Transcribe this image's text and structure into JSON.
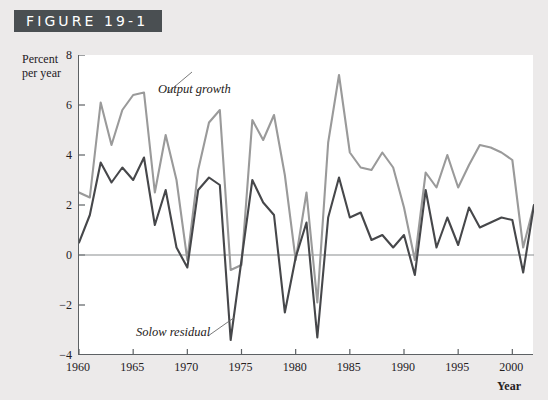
{
  "figure": {
    "banner_label": "FIGURE 19-1"
  },
  "axes": {
    "ylabel_line1": "Percent",
    "ylabel_line2": "per year",
    "xlabel": "Year",
    "yticks": [
      8,
      6,
      4,
      2,
      0,
      -2,
      -4
    ],
    "ytick_labels": [
      "8",
      "6",
      "4",
      "2",
      "0",
      "−2",
      "−4"
    ],
    "xticks": [
      1960,
      1965,
      1970,
      1975,
      1980,
      1985,
      1990,
      1995,
      2000
    ],
    "xtick_labels": [
      "1960",
      "1965",
      "1970",
      "1975",
      "1980",
      "1985",
      "1990",
      "1995",
      "2000"
    ]
  },
  "annotations": {
    "output_growth": "Output growth",
    "solow_residual": "Solow residual"
  },
  "colors": {
    "banner_background": "#4a4f52",
    "banner_text": "#ffffff",
    "page_background": "#eceaea",
    "plot_background": "#ffffff",
    "axis": "#5d6164",
    "zero_line": "#8a8e90",
    "output_growth_line": "#9a9a9a",
    "solow_residual_line": "#46474a",
    "leader_line": "#6b6b6b",
    "text": "#24201e"
  },
  "chart_data": {
    "type": "line",
    "title": "FIGURE 19-1",
    "xlabel": "Year",
    "ylabel": "Percent per year",
    "xlim": [
      1960,
      2002
    ],
    "ylim": [
      -4,
      8
    ],
    "ytick_step": 2,
    "grid": false,
    "legend": "inline-annotations",
    "zero_line": 0,
    "x": [
      1960,
      1961,
      1962,
      1963,
      1964,
      1965,
      1966,
      1967,
      1968,
      1969,
      1970,
      1971,
      1972,
      1973,
      1974,
      1975,
      1976,
      1977,
      1978,
      1979,
      1980,
      1981,
      1982,
      1983,
      1984,
      1985,
      1986,
      1987,
      1988,
      1989,
      1990,
      1991,
      1992,
      1993,
      1994,
      1995,
      1996,
      1997,
      1998,
      1999,
      2000,
      2001,
      2002
    ],
    "series": [
      {
        "name": "Output growth",
        "color": "#9a9a9a",
        "values": [
          2.5,
          2.3,
          6.1,
          4.4,
          5.8,
          6.4,
          6.5,
          2.5,
          4.8,
          3.0,
          -0.2,
          3.4,
          5.3,
          5.8,
          -0.6,
          -0.4,
          5.4,
          4.6,
          5.6,
          3.2,
          -0.2,
          2.5,
          -1.9,
          4.5,
          7.2,
          4.1,
          3.5,
          3.4,
          4.1,
          3.5,
          1.9,
          -0.2,
          3.3,
          2.7,
          4.0,
          2.7,
          3.6,
          4.4,
          4.3,
          4.1,
          3.8,
          0.3,
          2.0
        ]
      },
      {
        "name": "Solow residual",
        "color": "#46474a",
        "values": [
          0.5,
          1.6,
          3.7,
          2.9,
          3.5,
          3.0,
          3.9,
          1.2,
          2.6,
          0.3,
          -0.5,
          2.6,
          3.1,
          2.8,
          -3.4,
          -0.2,
          3.0,
          2.1,
          1.6,
          -2.3,
          -0.1,
          1.3,
          -3.3,
          1.5,
          3.1,
          1.5,
          1.7,
          0.6,
          0.8,
          0.3,
          0.8,
          -0.8,
          2.6,
          0.3,
          1.5,
          0.4,
          1.9,
          1.1,
          1.3,
          1.5,
          1.4,
          -0.7,
          2.0
        ]
      }
    ]
  }
}
